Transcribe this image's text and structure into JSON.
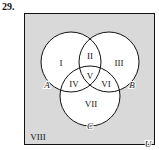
{
  "problem_number": "29.",
  "diagram": {
    "type": "venn-3-set",
    "universe_label": "U",
    "universe_fill": "#d9d9d9",
    "circle_fill": "#ffffff",
    "stroke": "#111111",
    "sets": [
      {
        "label": "A",
        "cx": 71,
        "cy": 62,
        "r": 30
      },
      {
        "label": "B",
        "cx": 109,
        "cy": 62,
        "r": 30
      },
      {
        "label": "C",
        "cx": 90,
        "cy": 96,
        "r": 30
      }
    ],
    "regions": [
      {
        "label": "I",
        "x": 61,
        "y": 63
      },
      {
        "label": "II",
        "x": 90,
        "y": 56
      },
      {
        "label": "III",
        "x": 119,
        "y": 63
      },
      {
        "label": "IV",
        "x": 74,
        "y": 84
      },
      {
        "label": "V",
        "x": 90,
        "y": 76
      },
      {
        "label": "VI",
        "x": 106,
        "y": 84
      },
      {
        "label": "VII",
        "x": 91,
        "y": 106
      },
      {
        "label": "VIII",
        "x": 38,
        "y": 139
      }
    ]
  }
}
